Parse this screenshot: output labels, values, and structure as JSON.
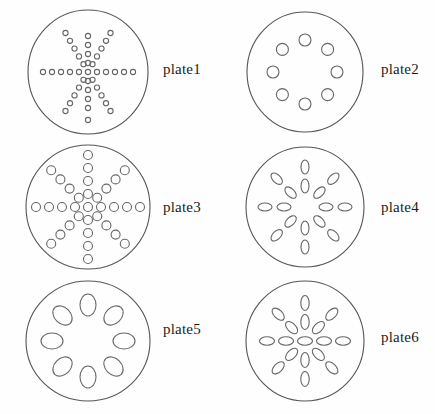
{
  "figure": {
    "background_color": "#fefefe",
    "outline_color": "#555555",
    "hole_color": "#666666",
    "label_color": "#1c1c1c",
    "width": 435,
    "height": 414
  },
  "plates": [
    {
      "id": "plate1",
      "label": "plate1",
      "label_x": 163,
      "label_y": 62,
      "circle": {
        "cx": 88,
        "cy": 72,
        "rx": 60,
        "ry": 62
      },
      "hole_shape": "circle",
      "hole_rx": 2.6,
      "hole_ry": 2.6,
      "hole_count": 37,
      "spokes": 6,
      "rings": 6,
      "pattern": "radial-star",
      "holes": [
        {
          "x": 88,
          "y": 72
        },
        {
          "x": 97,
          "y": 72
        },
        {
          "x": 106,
          "y": 72
        },
        {
          "x": 115,
          "y": 72
        },
        {
          "x": 124,
          "y": 72
        },
        {
          "x": 133,
          "y": 72
        },
        {
          "x": 79,
          "y": 72
        },
        {
          "x": 70,
          "y": 72
        },
        {
          "x": 61,
          "y": 72
        },
        {
          "x": 52,
          "y": 72
        },
        {
          "x": 43,
          "y": 72
        },
        {
          "x": 92.5,
          "y": 64.2
        },
        {
          "x": 97,
          "y": 56.4
        },
        {
          "x": 101.5,
          "y": 48.6
        },
        {
          "x": 106,
          "y": 40.8
        },
        {
          "x": 110.5,
          "y": 33
        },
        {
          "x": 83.5,
          "y": 79.8
        },
        {
          "x": 79,
          "y": 87.6
        },
        {
          "x": 74.5,
          "y": 95.4
        },
        {
          "x": 70,
          "y": 103.2
        },
        {
          "x": 65.5,
          "y": 111
        },
        {
          "x": 83.5,
          "y": 64.2
        },
        {
          "x": 79,
          "y": 56.4
        },
        {
          "x": 74.5,
          "y": 48.6
        },
        {
          "x": 70,
          "y": 40.8
        },
        {
          "x": 65.5,
          "y": 33
        },
        {
          "x": 92.5,
          "y": 79.8
        },
        {
          "x": 97,
          "y": 87.6
        },
        {
          "x": 101.5,
          "y": 95.4
        },
        {
          "x": 106,
          "y": 103.2
        },
        {
          "x": 110.5,
          "y": 111
        },
        {
          "x": 88,
          "y": 63
        },
        {
          "x": 88,
          "y": 54
        },
        {
          "x": 88,
          "y": 45
        },
        {
          "x": 88,
          "y": 36
        },
        {
          "x": 88,
          "y": 81
        },
        {
          "x": 88,
          "y": 90
        },
        {
          "x": 88,
          "y": 99
        },
        {
          "x": 88,
          "y": 108
        },
        {
          "x": 88,
          "y": 120
        }
      ]
    },
    {
      "id": "plate2",
      "label": "plate2",
      "label_x": 381,
      "label_y": 62,
      "circle": {
        "cx": 305,
        "cy": 72,
        "rx": 58,
        "ry": 60
      },
      "hole_shape": "circle",
      "hole_rx": 6,
      "hole_ry": 6,
      "hole_count": 8,
      "spokes": 8,
      "rings": 1,
      "pattern": "single-ring",
      "ring_radius": 32,
      "holes": [
        {
          "x": 305,
          "y": 40
        },
        {
          "x": 327.6,
          "y": 49.4
        },
        {
          "x": 337,
          "y": 72
        },
        {
          "x": 327.6,
          "y": 94.6
        },
        {
          "x": 305,
          "y": 104
        },
        {
          "x": 282.4,
          "y": 94.6
        },
        {
          "x": 273,
          "y": 72
        },
        {
          "x": 282.4,
          "y": 49.4
        }
      ]
    },
    {
      "id": "plate3",
      "label": "plate3",
      "label_x": 163,
      "label_y": 200,
      "circle": {
        "cx": 88,
        "cy": 207,
        "rx": 62,
        "ry": 62
      },
      "hole_shape": "circle",
      "hole_rx": 4.5,
      "hole_ry": 4.5,
      "hole_count": 41,
      "spokes": 8,
      "rings": 5,
      "pattern": "radial-star",
      "holes": [
        {
          "x": 88,
          "y": 207
        },
        {
          "x": 88,
          "y": 194
        },
        {
          "x": 88,
          "y": 181
        },
        {
          "x": 88,
          "y": 168
        },
        {
          "x": 88,
          "y": 155
        },
        {
          "x": 88,
          "y": 220
        },
        {
          "x": 88,
          "y": 233
        },
        {
          "x": 88,
          "y": 246
        },
        {
          "x": 88,
          "y": 259
        },
        {
          "x": 101,
          "y": 207
        },
        {
          "x": 114,
          "y": 207
        },
        {
          "x": 127,
          "y": 207
        },
        {
          "x": 140,
          "y": 207
        },
        {
          "x": 75,
          "y": 207
        },
        {
          "x": 62,
          "y": 207
        },
        {
          "x": 49,
          "y": 207
        },
        {
          "x": 36,
          "y": 207
        },
        {
          "x": 97.2,
          "y": 197.8
        },
        {
          "x": 106.4,
          "y": 188.6
        },
        {
          "x": 115.6,
          "y": 179.4
        },
        {
          "x": 124.8,
          "y": 170.2
        },
        {
          "x": 78.8,
          "y": 216.2
        },
        {
          "x": 69.6,
          "y": 225.4
        },
        {
          "x": 60.4,
          "y": 234.6
        },
        {
          "x": 51.2,
          "y": 243.8
        },
        {
          "x": 78.8,
          "y": 197.8
        },
        {
          "x": 69.6,
          "y": 188.6
        },
        {
          "x": 60.4,
          "y": 179.4
        },
        {
          "x": 51.2,
          "y": 170.2
        },
        {
          "x": 97.2,
          "y": 216.2
        },
        {
          "x": 106.4,
          "y": 225.4
        },
        {
          "x": 115.6,
          "y": 234.6
        },
        {
          "x": 124.8,
          "y": 243.8
        }
      ]
    },
    {
      "id": "plate4",
      "label": "plate4",
      "label_x": 381,
      "label_y": 200,
      "circle": {
        "cx": 305,
        "cy": 207,
        "rx": 59,
        "ry": 60
      },
      "hole_shape": "ellipse",
      "hole_rx": 7,
      "hole_ry": 4,
      "hole_count": 16,
      "spokes": 8,
      "rings": 2,
      "pattern": "radial-pairs",
      "holes": [
        {
          "x": 305,
          "y": 167,
          "angle": 90
        },
        {
          "x": 305,
          "y": 186,
          "angle": 90
        },
        {
          "x": 333.3,
          "y": 178.7,
          "angle": 45
        },
        {
          "x": 319.4,
          "y": 192.6,
          "angle": 45
        },
        {
          "x": 345,
          "y": 207,
          "angle": 0
        },
        {
          "x": 326,
          "y": 207,
          "angle": 0
        },
        {
          "x": 333.3,
          "y": 235.3,
          "angle": 135
        },
        {
          "x": 319.4,
          "y": 221.4,
          "angle": 135
        },
        {
          "x": 305,
          "y": 247,
          "angle": 90
        },
        {
          "x": 305,
          "y": 228,
          "angle": 90
        },
        {
          "x": 276.7,
          "y": 235.3,
          "angle": 45
        },
        {
          "x": 290.6,
          "y": 221.4,
          "angle": 45
        },
        {
          "x": 265,
          "y": 207,
          "angle": 0
        },
        {
          "x": 284,
          "y": 207,
          "angle": 0
        },
        {
          "x": 276.7,
          "y": 178.7,
          "angle": 135
        },
        {
          "x": 290.6,
          "y": 192.6,
          "angle": 135
        }
      ]
    },
    {
      "id": "plate5",
      "label": "plate5",
      "label_x": 163,
      "label_y": 322,
      "circle": {
        "cx": 88,
        "cy": 341,
        "rx": 62,
        "ry": 60
      },
      "hole_shape": "ellipse",
      "hole_rx": 11,
      "hole_ry": 8,
      "hole_count": 8,
      "spokes": 8,
      "rings": 1,
      "pattern": "single-ring",
      "ring_radius": 36,
      "holes": [
        {
          "x": 88,
          "y": 305,
          "angle": 90
        },
        {
          "x": 113.5,
          "y": 315.5,
          "angle": 45
        },
        {
          "x": 124,
          "y": 341,
          "angle": 0
        },
        {
          "x": 113.5,
          "y": 366.5,
          "angle": 135
        },
        {
          "x": 88,
          "y": 377,
          "angle": 90
        },
        {
          "x": 62.5,
          "y": 366.5,
          "angle": 45
        },
        {
          "x": 52,
          "y": 341,
          "angle": 0
        },
        {
          "x": 62.5,
          "y": 315.5,
          "angle": 135
        }
      ]
    },
    {
      "id": "plate6",
      "label": "plate6",
      "label_x": 381,
      "label_y": 330,
      "circle": {
        "cx": 305,
        "cy": 341,
        "rx": 59,
        "ry": 60
      },
      "hole_shape": "ellipse",
      "hole_rx": 7.5,
      "hole_ry": 4.2,
      "hole_count": 25,
      "spokes": 8,
      "rings": 3,
      "pattern": "radial-star",
      "holes": [
        {
          "x": 305,
          "y": 341,
          "angle": 0
        },
        {
          "x": 305,
          "y": 322,
          "angle": 90
        },
        {
          "x": 305,
          "y": 303,
          "angle": 90
        },
        {
          "x": 305,
          "y": 360,
          "angle": 90
        },
        {
          "x": 305,
          "y": 379,
          "angle": 90
        },
        {
          "x": 324,
          "y": 341,
          "angle": 0
        },
        {
          "x": 343,
          "y": 341,
          "angle": 0
        },
        {
          "x": 286,
          "y": 341,
          "angle": 0
        },
        {
          "x": 267,
          "y": 341,
          "angle": 0
        },
        {
          "x": 318.4,
          "y": 327.6,
          "angle": 45
        },
        {
          "x": 331.8,
          "y": 314.2,
          "angle": 45
        },
        {
          "x": 291.6,
          "y": 354.4,
          "angle": 45
        },
        {
          "x": 278.2,
          "y": 367.8,
          "angle": 45
        },
        {
          "x": 291.6,
          "y": 327.6,
          "angle": 135
        },
        {
          "x": 278.2,
          "y": 314.2,
          "angle": 135
        },
        {
          "x": 318.4,
          "y": 354.4,
          "angle": 135
        },
        {
          "x": 331.8,
          "y": 367.8,
          "angle": 135
        }
      ]
    }
  ]
}
